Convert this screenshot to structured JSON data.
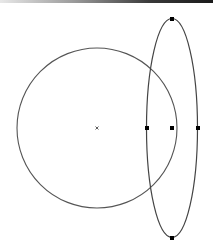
{
  "canvas": {
    "width": 213,
    "height": 250,
    "background": "#ffffff",
    "top_bar": {
      "height": 3,
      "gradient_from": "#e8e8e8",
      "gradient_to": "#1a1a1a"
    }
  },
  "shapes": {
    "circle": {
      "cx": 97,
      "cy": 128,
      "r": 80,
      "stroke": "#555555",
      "stroke_width": 1.1,
      "center_marker": {
        "x": 97,
        "y": 128,
        "glyph": "×",
        "icon": "center-cross-icon",
        "color": "#333333"
      }
    },
    "ellipse": {
      "cx": 172,
      "cy": 128,
      "rx": 25.5,
      "ry": 109.5,
      "stroke": "#444444",
      "stroke_width": 1.2,
      "handles": [
        {
          "name": "top",
          "x": 172,
          "y": 19
        },
        {
          "name": "bottom",
          "x": 172,
          "y": 238
        },
        {
          "name": "left",
          "x": 147,
          "y": 128
        },
        {
          "name": "right",
          "x": 198,
          "y": 128
        },
        {
          "name": "center",
          "x": 172,
          "y": 128
        }
      ],
      "handle_size": 4,
      "handle_color": "#000000"
    }
  }
}
